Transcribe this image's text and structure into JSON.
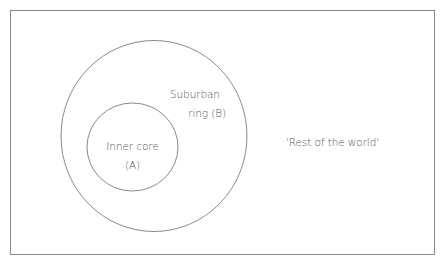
{
  "diagram": {
    "type": "nested-regions",
    "colors": {
      "stroke": "#8a8a8a",
      "text": "#555555",
      "background": "#ffffff"
    },
    "regions": [
      {
        "id": "A",
        "label_line1": "Inner core",
        "label_line2": "(A)"
      },
      {
        "id": "B",
        "label_line1": "Suburban",
        "label_line2": "ring (B)"
      },
      {
        "id": "rest",
        "label": "'Rest of the world'"
      }
    ]
  }
}
